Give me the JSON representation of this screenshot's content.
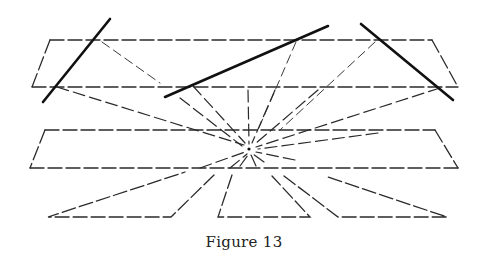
{
  "figure": {
    "caption": "Figure 13",
    "colors": {
      "ink": "#2a2a2a",
      "thick_ink": "#111111",
      "background": "#ffffff"
    },
    "vanishing_point": {
      "x": 249,
      "y": 149
    },
    "upper_band": {
      "top": {
        "x1": 50,
        "x2": 432,
        "y": 40
      },
      "bottom": {
        "x1": 32,
        "x2": 458,
        "y": 87
      }
    },
    "middle_band": {
      "top": {
        "x1": 45,
        "x2": 435,
        "y": 130
      },
      "bottom": {
        "x1": 30,
        "x2": 458,
        "y": 168
      }
    },
    "thick_lines": [
      {
        "x1": 43,
        "y1": 102,
        "x2": 110,
        "y2": 19
      },
      {
        "x1": 165,
        "y1": 97,
        "x2": 328,
        "y2": 26
      },
      {
        "x1": 361,
        "y1": 24,
        "x2": 453,
        "y2": 100
      }
    ],
    "bottom_shapes": [
      {
        "name": "left-triangle",
        "points": "48,217 200,172 172,217"
      },
      {
        "name": "center-trapezoid",
        "points": "218,217 232,175 275,217"
      },
      {
        "name": "right-triangle",
        "points": "283,176 340,217 445,217 325,175"
      }
    ]
  }
}
